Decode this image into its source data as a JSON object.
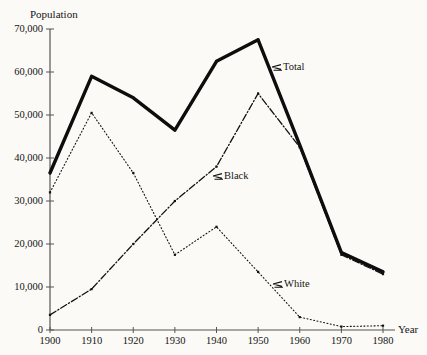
{
  "figure": {
    "background_color": "#fbfaf7",
    "ink_color": "#111111"
  },
  "axes": {
    "y_title": "Population",
    "x_title": "Year",
    "y_ticks": [
      "0",
      "10,000",
      "20,000",
      "30,000",
      "40,000",
      "50,000",
      "60,000",
      "70,000"
    ],
    "x_ticks": [
      "1900",
      "1910",
      "1920",
      "1930",
      "1940",
      "1950",
      "1960",
      "1970",
      "1980"
    ]
  },
  "series_labels": {
    "total": "Total",
    "black": "Black",
    "white": "White",
    "pointer_glyph": "⇐"
  },
  "chart_data": {
    "type": "line",
    "title": "",
    "xlabel": "Year",
    "ylabel": "Population",
    "x": [
      1900,
      1910,
      1920,
      1930,
      1940,
      1950,
      1960,
      1970,
      1980
    ],
    "xlim": [
      1900,
      1980
    ],
    "ylim": [
      0,
      70000
    ],
    "ytick_values": [
      0,
      10000,
      20000,
      30000,
      40000,
      50000,
      60000,
      70000
    ],
    "grid": false,
    "legend": "inline-annotations",
    "series": [
      {
        "name": "Total",
        "style": "thick-solid",
        "values": [
          36500,
          59000,
          54000,
          46500,
          62500,
          67500,
          43000,
          18000,
          13500
        ]
      },
      {
        "name": "Black",
        "style": "dash-dot",
        "values": [
          3500,
          9500,
          20000,
          30000,
          38000,
          55000,
          42500,
          17500,
          13000
        ]
      },
      {
        "name": "White",
        "style": "dotted",
        "values": [
          32000,
          50500,
          36500,
          17500,
          24000,
          13500,
          3000,
          800,
          1000
        ]
      }
    ]
  }
}
